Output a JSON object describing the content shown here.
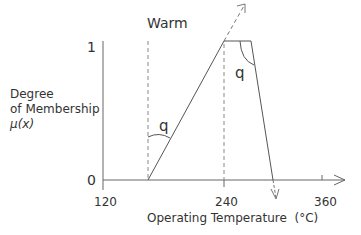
{
  "diagram": {
    "set_label": "Warm",
    "y_axis": {
      "title_line1": "Degree",
      "title_line2": "of Membership",
      "title_line3": "μ(x)",
      "tick_top": "1",
      "tick_bottom": "0"
    },
    "x_axis": {
      "title": "Operating Temperature  (°C)",
      "ticks": [
        "120",
        "240",
        "360"
      ]
    },
    "angle_labels": [
      "q",
      "q"
    ],
    "colors": {
      "line": "#555555",
      "text": "#333333",
      "background": "#ffffff"
    }
  }
}
